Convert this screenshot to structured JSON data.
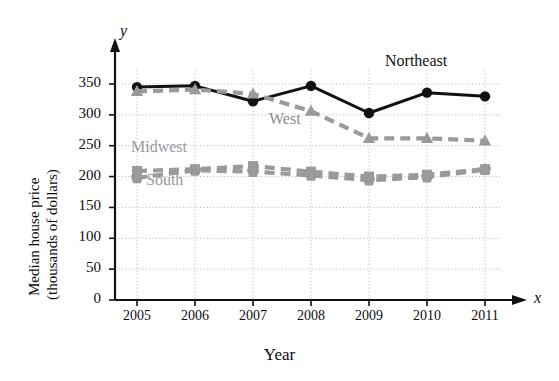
{
  "chart_data": {
    "type": "line",
    "title": "",
    "xlabel": "Year",
    "ylabel": "Median house price (thousands of dollars)",
    "ylabel_line1": "Median house price",
    "ylabel_line2": "(thousands of dollars)",
    "x_axis_letter": "x",
    "y_axis_letter": "y",
    "categories": [
      "2005",
      "2006",
      "2007",
      "2008",
      "2009",
      "2010",
      "2011"
    ],
    "x": [
      2005,
      2006,
      2007,
      2008,
      2009,
      2010,
      2011
    ],
    "xlim": [
      2005,
      2011
    ],
    "ylim": [
      0,
      350
    ],
    "yticks": [
      "0",
      "50",
      "100",
      "150",
      "200",
      "250",
      "300",
      "350"
    ],
    "ytick_values": [
      0,
      50,
      100,
      150,
      200,
      250,
      300,
      350
    ],
    "grid": true,
    "legend": "inline-annotations",
    "series": [
      {
        "name": "Northeast",
        "values": [
          345,
          347,
          322,
          347,
          303,
          336,
          330
        ],
        "color": "#111111",
        "marker": "circle",
        "linestyle": "solid"
      },
      {
        "name": "West",
        "values": [
          338,
          341,
          334,
          306,
          262,
          262,
          258
        ],
        "color": "#9a9a9a",
        "marker": "triangle",
        "linestyle": "dashed"
      },
      {
        "name": "Midwest",
        "values": [
          209,
          212,
          217,
          208,
          200,
          203,
          212
        ],
        "color": "#9a9a9a",
        "marker": "square",
        "linestyle": "dashed"
      },
      {
        "name": "South",
        "values": [
          198,
          210,
          208,
          202,
          194,
          199,
          211
        ],
        "color": "#9a9a9a",
        "marker": "pentagon",
        "linestyle": "dashed"
      }
    ],
    "annotations": [
      {
        "text": "Northeast",
        "series": "Northeast"
      },
      {
        "text": "West",
        "series": "West"
      },
      {
        "text": "Midwest",
        "series": "Midwest"
      },
      {
        "text": "South",
        "series": "South"
      }
    ]
  }
}
